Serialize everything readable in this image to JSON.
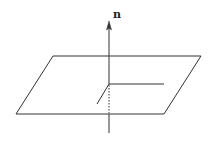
{
  "diagram": {
    "normal_label": "n",
    "colors": {
      "stroke": "#333333",
      "background": "#ffffff"
    },
    "plane": {
      "corners": [
        [
          53,
          56
        ],
        [
          201,
          56
        ],
        [
          164,
          114
        ],
        [
          16,
          114
        ]
      ]
    },
    "normal_vector": {
      "base": [
        109,
        84
      ],
      "tip": [
        109,
        22
      ],
      "below_plane_start": [
        109,
        114
      ],
      "below_plane_end": [
        109,
        133
      ],
      "hidden_segment": [
        [
          109,
          84
        ],
        [
          109,
          114
        ]
      ]
    },
    "in_plane_axes": [
      {
        "from": [
          109,
          84
        ],
        "to": [
          164,
          84
        ]
      },
      {
        "from": [
          109,
          84
        ],
        "to": [
          97,
          104
        ]
      }
    ]
  }
}
